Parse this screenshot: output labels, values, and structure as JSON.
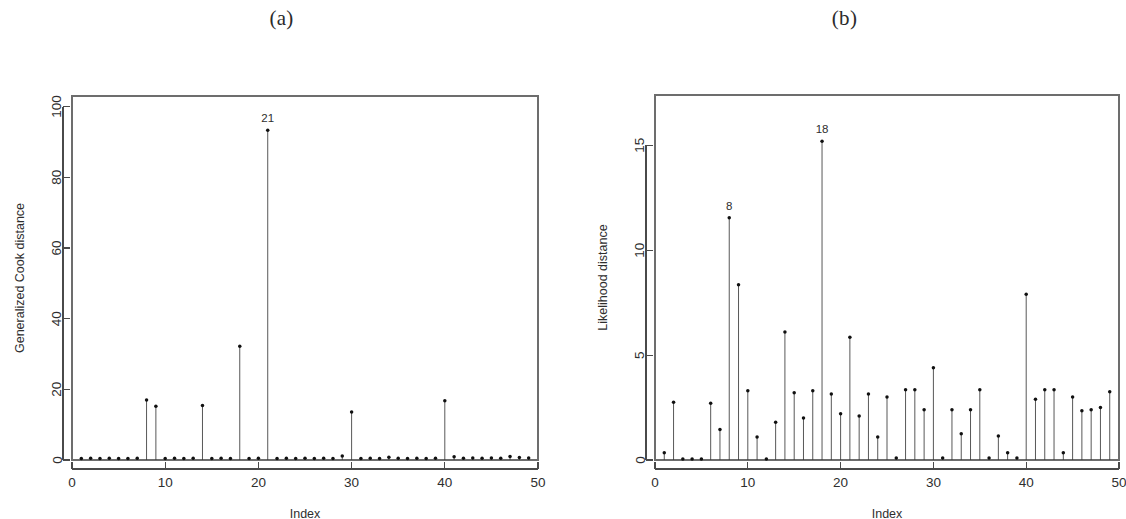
{
  "figure": {
    "background_color": "#ffffff",
    "ink_color": "#1a1a1a",
    "panels": [
      {
        "id": "panel-a",
        "title": "(a)",
        "xlabel": "Index",
        "ylabel": "Generalized Cook distance"
      },
      {
        "id": "panel-b",
        "title": "(b)",
        "xlabel": "Index",
        "ylabel": "Likelihood distance"
      }
    ]
  },
  "chart_data": [
    {
      "type": "line",
      "subtype": "index-plot-with-spikes",
      "panel": "(a)",
      "title": "(a)",
      "xlabel": "Index",
      "ylabel": "Generalized Cook distance",
      "xlim": [
        0,
        50
      ],
      "ylim": [
        0,
        103
      ],
      "xticks": [
        0,
        10,
        20,
        30,
        40,
        50
      ],
      "yticks": [
        0,
        20,
        40,
        60,
        80,
        100
      ],
      "xtick_labels": [
        "0",
        "10",
        "20",
        "30",
        "40",
        "50"
      ],
      "ytick_labels": [
        "0",
        "20",
        "40",
        "60",
        "80",
        "100"
      ],
      "grid": false,
      "legend": false,
      "x": [
        1,
        2,
        3,
        4,
        5,
        6,
        7,
        8,
        9,
        10,
        11,
        12,
        13,
        14,
        15,
        16,
        17,
        18,
        19,
        20,
        21,
        22,
        23,
        24,
        25,
        26,
        27,
        28,
        29,
        30,
        31,
        32,
        33,
        34,
        35,
        36,
        37,
        38,
        39,
        40,
        41,
        42,
        43,
        44,
        45,
        46,
        47,
        48,
        49
      ],
      "values": [
        0.4,
        0.5,
        0.4,
        0.5,
        0.4,
        0.4,
        0.5,
        17.0,
        15.2,
        0.4,
        0.5,
        0.4,
        0.5,
        15.4,
        0.4,
        0.5,
        0.4,
        32.2,
        0.4,
        0.5,
        93.3,
        0.4,
        0.5,
        0.4,
        0.5,
        0.4,
        0.5,
        0.4,
        1.1,
        13.6,
        0.4,
        0.5,
        0.4,
        0.8,
        0.5,
        0.4,
        0.5,
        0.4,
        0.5,
        16.8,
        0.9,
        0.5,
        0.6,
        0.5,
        0.6,
        0.5,
        1.0,
        0.7,
        0.6
      ],
      "annotations": [
        {
          "label": "21",
          "x": 21,
          "y": 93.3
        }
      ]
    },
    {
      "type": "line",
      "subtype": "index-plot-with-spikes",
      "panel": "(b)",
      "title": "(b)",
      "xlabel": "Index",
      "ylabel": "Likelihood distance",
      "xlim": [
        0,
        50
      ],
      "ylim": [
        0,
        17.4
      ],
      "xticks": [
        0,
        10,
        20,
        30,
        40,
        50
      ],
      "yticks": [
        0,
        5,
        10,
        15
      ],
      "xtick_labels": [
        "0",
        "10",
        "20",
        "30",
        "40",
        "50"
      ],
      "ytick_labels": [
        "0",
        "5",
        "10",
        "15"
      ],
      "grid": false,
      "legend": false,
      "x": [
        1,
        2,
        3,
        4,
        5,
        6,
        7,
        8,
        9,
        10,
        11,
        12,
        13,
        14,
        15,
        16,
        17,
        18,
        19,
        20,
        21,
        22,
        23,
        24,
        25,
        26,
        27,
        28,
        29,
        30,
        31,
        32,
        33,
        34,
        35,
        36,
        37,
        38,
        39,
        40,
        41,
        42,
        43,
        44,
        45,
        46,
        47,
        48,
        49
      ],
      "values": [
        0.35,
        2.75,
        0.05,
        0.05,
        0.05,
        2.7,
        1.45,
        11.55,
        8.35,
        3.3,
        1.1,
        0.05,
        1.8,
        6.1,
        3.2,
        2.0,
        3.3,
        15.2,
        3.15,
        2.2,
        5.85,
        2.1,
        3.15,
        1.1,
        3.0,
        0.1,
        3.35,
        3.35,
        2.4,
        4.4,
        0.1,
        2.4,
        1.25,
        2.4,
        3.35,
        0.1,
        1.15,
        0.35,
        0.1,
        7.9,
        2.9,
        3.35,
        3.35,
        0.35,
        3.0,
        2.35,
        2.4,
        2.5,
        3.25
      ],
      "annotations": [
        {
          "label": "8",
          "x": 8,
          "y": 11.55
        },
        {
          "label": "18",
          "x": 18,
          "y": 15.2
        }
      ]
    }
  ]
}
